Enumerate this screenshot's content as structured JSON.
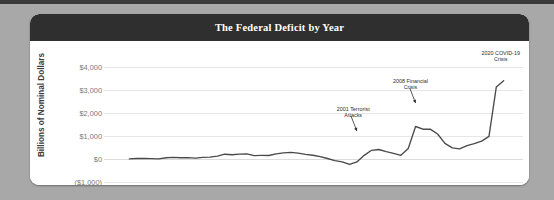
{
  "header": {
    "title": "The Federal Deficit by Year"
  },
  "axes": {
    "ylabel": "Billions of Nominal Dollars",
    "yticks": [
      "$4,000",
      "$3,000",
      "$2,000",
      "$1,000",
      "$0",
      "($1,000)"
    ],
    "xticks": [
      "1970",
      "1980",
      "1990",
      "2000",
      "2010",
      "2020"
    ]
  },
  "annotations": [
    {
      "id": "terror",
      "line1": "2001 Terrorist",
      "line2": "Attacks"
    },
    {
      "id": "financial",
      "line1": "2008 Financial",
      "line2": "Crisis"
    },
    {
      "id": "covid",
      "line1": "2020 COVID-19",
      "line2": "Crisis"
    }
  ],
  "colors": {
    "page_background": "#a8a8a8",
    "card_background": "#ffffff",
    "titlebar": "#2f2f2f",
    "title_text": "#ffffff",
    "series": "#4a4a4a",
    "gridline": "#e6e6e6",
    "tick_text": "#7a7a7a",
    "axis_label_text": "#3b3b3b"
  },
  "chart_data": {
    "type": "line",
    "title": "The Federal Deficit by Year",
    "xlabel": "",
    "ylabel": "Billions of Nominal Dollars",
    "xlim": [
      1969,
      2022
    ],
    "ylim": [
      -1000,
      4000
    ],
    "grid": true,
    "legend": "none",
    "series": [
      {
        "name": "Federal Deficit",
        "x": [
          1970,
          1971,
          1972,
          1973,
          1974,
          1975,
          1976,
          1977,
          1978,
          1979,
          1980,
          1981,
          1982,
          1983,
          1984,
          1985,
          1986,
          1987,
          1988,
          1989,
          1990,
          1991,
          1992,
          1993,
          1994,
          1995,
          1996,
          1997,
          1998,
          1999,
          2000,
          2001,
          2002,
          2003,
          2004,
          2005,
          2006,
          2007,
          2008,
          2009,
          2010,
          2011,
          2012,
          2013,
          2014,
          2015,
          2016,
          2017,
          2018,
          2019,
          2020,
          2021
        ],
        "values": [
          3,
          23,
          23,
          15,
          6,
          53,
          74,
          54,
          59,
          41,
          74,
          79,
          128,
          208,
          185,
          212,
          221,
          150,
          155,
          153,
          221,
          269,
          290,
          255,
          203,
          164,
          107,
          22,
          -69,
          -126,
          -236,
          -128,
          158,
          378,
          413,
          318,
          248,
          161,
          459,
          1413,
          1294,
          1300,
          1087,
          680,
          485,
          442,
          585,
          665,
          779,
          984,
          3132,
          3400
        ]
      }
    ],
    "annotations": [
      {
        "label": "2001 Terrorist Attacks",
        "points_to_year": 2001,
        "points_to_value": -236
      },
      {
        "label": "2008 Financial Crisis",
        "points_to_year": 2009,
        "points_to_value": 1413
      },
      {
        "label": "2020 COVID-19 Crisis",
        "points_to_year": 2021,
        "points_to_value": 3400
      }
    ]
  }
}
